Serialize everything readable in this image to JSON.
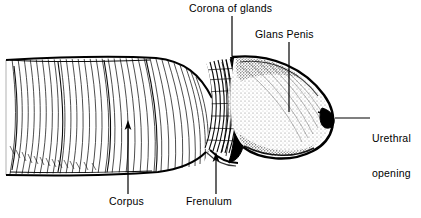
{
  "figure": {
    "type": "line-art anatomical illustration",
    "width": 421,
    "height": 218,
    "background_color": "#ffffff",
    "ink_color": "#000000"
  },
  "labels": {
    "corona": {
      "text": "Corona of glands",
      "leader": "vertical line descending to the corona ridge"
    },
    "glans": {
      "text": "Glans Penis",
      "leader": "vertical line descending into the glans body"
    },
    "urethral": {
      "line1": "Urethral",
      "line2": "opening",
      "leader": "horizontal line pointing left to the meatus"
    },
    "corpus": {
      "text": "Corpus",
      "leader": "vertical arrow pointing up into the shaft"
    },
    "frenulum": {
      "text": "Frenulum",
      "leader": "vertical arrow pointing up to the frenulum"
    }
  },
  "parts": {
    "shaft": "corpus / shaft with curved hatching",
    "corona_ridge": "corona of glans ridge band",
    "glans_dome": "stippled glans dome",
    "meatus": "dark urethral opening notch"
  }
}
